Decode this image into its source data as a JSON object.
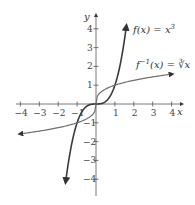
{
  "chart_data": {
    "type": "line",
    "title": "",
    "xlabel": "x",
    "ylabel": "y",
    "xlim": [
      -4,
      4
    ],
    "ylim": [
      -4,
      4
    ],
    "x_ticks": [
      -4,
      -3,
      -2,
      -1,
      1,
      2,
      3,
      4
    ],
    "y_ticks": [
      4,
      3,
      2,
      1,
      -1,
      -2,
      -3,
      -4
    ],
    "x_tick_labels": [
      "−4",
      "−3",
      "−2",
      "−1",
      "1",
      "2",
      "3",
      "4"
    ],
    "y_tick_labels": [
      "4",
      "3",
      "2",
      "1",
      "−1",
      "−2",
      "−3",
      "−4"
    ],
    "grid": false,
    "series": [
      {
        "name": "f(x) = x³",
        "label": "f(x) = x³",
        "function": "x^3",
        "color": "#3a3a3a",
        "x": [
          -1.6,
          -1.5,
          -1,
          -0.5,
          0,
          0.5,
          1,
          1.5,
          1.6
        ],
        "y": [
          -4.1,
          -3.375,
          -1,
          -0.125,
          0,
          0.125,
          1,
          3.375,
          4.1
        ]
      },
      {
        "name": "f⁻¹(x) = ∛x",
        "label": "f⁻¹(x) = ∛x",
        "function": "cbrt(x)",
        "color": "#6a6a6a",
        "x": [
          -4,
          -3,
          -2,
          -1,
          -0.125,
          0,
          0.125,
          1,
          2,
          3,
          4
        ],
        "y": [
          -1.587,
          -1.442,
          -1.26,
          -1,
          -0.5,
          0,
          0.5,
          1,
          1.26,
          1.442,
          1.587
        ]
      }
    ],
    "annotations": [
      {
        "text": "f(x) = x³",
        "near": [
          1.9,
          4
        ]
      },
      {
        "text": "f⁻¹(x) = ∛x",
        "near": [
          2.2,
          2
        ]
      }
    ]
  },
  "labels": {
    "x_axis": "x",
    "y_axis": "y",
    "f_label_main": "f(x) = x",
    "f_label_exp": "3",
    "finv_label_main": "f",
    "finv_label_exp": "−1",
    "finv_label_rest": "(x) = ∛x"
  }
}
